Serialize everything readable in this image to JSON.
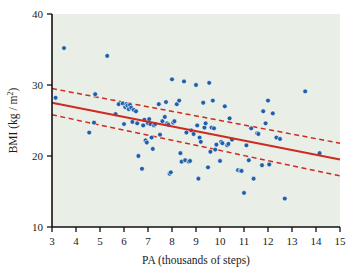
{
  "chart_data": {
    "type": "scatter",
    "title": "",
    "xlabel": "PA (thousands of steps)",
    "ylabel": "BMI (kg / m",
    "ylabel_sup": "2",
    "ylabel_tail": ")",
    "xlim": [
      3,
      15
    ],
    "ylim": [
      10,
      40
    ],
    "xticks": [
      3,
      4,
      5,
      6,
      7,
      8,
      9,
      10,
      11,
      12,
      13,
      14,
      15
    ],
    "yticks": [
      10,
      20,
      30,
      40
    ],
    "grid": false,
    "legend": "none",
    "plot_background": "#e9efe7",
    "point_color": "#1f5fa8",
    "line_color": "#cf2a20",
    "point_radius": 2.4,
    "points": [
      [
        3.15,
        28.2
      ],
      [
        3.5,
        35.2
      ],
      [
        4.55,
        23.3
      ],
      [
        4.75,
        24.7
      ],
      [
        4.8,
        28.7
      ],
      [
        5.3,
        34.1
      ],
      [
        5.65,
        25.9
      ],
      [
        5.78,
        27.3
      ],
      [
        5.95,
        27.4
      ],
      [
        6.0,
        24.5
      ],
      [
        6.05,
        26.9
      ],
      [
        6.1,
        27.3
      ],
      [
        6.15,
        27.1
      ],
      [
        6.2,
        26.6
      ],
      [
        6.25,
        27.2
      ],
      [
        6.3,
        26.8
      ],
      [
        6.35,
        24.8
      ],
      [
        6.4,
        26.5
      ],
      [
        6.5,
        26.3
      ],
      [
        6.55,
        24.6
      ],
      [
        6.6,
        20.0
      ],
      [
        6.75,
        18.2
      ],
      [
        6.8,
        24.3
      ],
      [
        6.85,
        25.1
      ],
      [
        6.9,
        22.2
      ],
      [
        6.95,
        21.9
      ],
      [
        7.0,
        24.6
      ],
      [
        7.05,
        25.2
      ],
      [
        7.1,
        24.5
      ],
      [
        7.15,
        22.6
      ],
      [
        7.2,
        21.0
      ],
      [
        7.25,
        24.3
      ],
      [
        7.3,
        24.5
      ],
      [
        7.45,
        27.3
      ],
      [
        7.5,
        23.0
      ],
      [
        7.6,
        24.9
      ],
      [
        7.7,
        25.5
      ],
      [
        7.75,
        27.6
      ],
      [
        7.8,
        24.6
      ],
      [
        7.85,
        24.4
      ],
      [
        7.9,
        17.5
      ],
      [
        7.95,
        17.7
      ],
      [
        8.0,
        30.8
      ],
      [
        8.05,
        24.7
      ],
      [
        8.1,
        24.9
      ],
      [
        8.2,
        27.3
      ],
      [
        8.3,
        27.8
      ],
      [
        8.35,
        20.4
      ],
      [
        8.4,
        19.2
      ],
      [
        8.5,
        30.5
      ],
      [
        8.55,
        19.4
      ],
      [
        8.6,
        23.3
      ],
      [
        8.7,
        19.2
      ],
      [
        8.75,
        19.3
      ],
      [
        8.8,
        23.6
      ],
      [
        8.9,
        23.1
      ],
      [
        9.0,
        30.0
      ],
      [
        9.05,
        24.3
      ],
      [
        9.1,
        16.8
      ],
      [
        9.15,
        22.6
      ],
      [
        9.2,
        22.0
      ],
      [
        9.3,
        27.5
      ],
      [
        9.35,
        24.0
      ],
      [
        9.4,
        24.6
      ],
      [
        9.5,
        18.4
      ],
      [
        9.55,
        30.3
      ],
      [
        9.6,
        20.6
      ],
      [
        9.65,
        24.0
      ],
      [
        9.7,
        27.8
      ],
      [
        9.75,
        23.9
      ],
      [
        9.8,
        20.9
      ],
      [
        9.85,
        21.6
      ],
      [
        10.0,
        19.3
      ],
      [
        10.05,
        22.0
      ],
      [
        10.1,
        21.8
      ],
      [
        10.2,
        27.0
      ],
      [
        10.3,
        21.5
      ],
      [
        10.35,
        21.7
      ],
      [
        10.4,
        25.3
      ],
      [
        10.5,
        22.3
      ],
      [
        10.75,
        18.0
      ],
      [
        10.85,
        17.9
      ],
      [
        10.9,
        17.9
      ],
      [
        11.0,
        14.8
      ],
      [
        11.1,
        21.5
      ],
      [
        11.2,
        19.4
      ],
      [
        11.3,
        23.9
      ],
      [
        11.4,
        16.8
      ],
      [
        11.55,
        23.2
      ],
      [
        11.6,
        23.1
      ],
      [
        11.75,
        18.7
      ],
      [
        11.8,
        26.3
      ],
      [
        11.9,
        24.6
      ],
      [
        12.0,
        27.8
      ],
      [
        12.05,
        18.8
      ],
      [
        12.2,
        26.0
      ],
      [
        12.35,
        22.6
      ],
      [
        12.5,
        22.4
      ],
      [
        12.7,
        14.0
      ],
      [
        13.55,
        29.1
      ],
      [
        14.15,
        20.4
      ]
    ],
    "fit_line": {
      "name": "regression-line",
      "style": "solid",
      "x": [
        3,
        15
      ],
      "y": [
        27.5,
        19.5
      ]
    },
    "confidence_bands": [
      {
        "name": "upper-confidence-band",
        "style": "dashed",
        "x": [
          3,
          15
        ],
        "y": [
          29.5,
          21.8
        ]
      },
      {
        "name": "lower-confidence-band",
        "style": "dashed",
        "x": [
          3,
          15
        ],
        "y": [
          25.8,
          17.2
        ]
      }
    ]
  }
}
